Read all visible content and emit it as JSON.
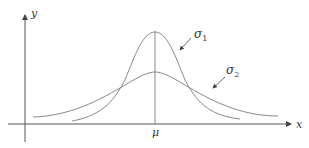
{
  "diagram": {
    "type": "normal distributions comparison",
    "axes": {
      "x_label": "x",
      "y_label": "y",
      "mean_label": "μ"
    },
    "curves": [
      {
        "name": "sigma1",
        "label": "σ",
        "subscript": "1",
        "description": "narrow, tall bell curve"
      },
      {
        "name": "sigma2",
        "label": "σ",
        "subscript": "2",
        "description": "wide, flat bell curve"
      }
    ],
    "colors": {
      "curve": "#8a8a8a",
      "axis": "#555555",
      "text": "#333333"
    }
  }
}
